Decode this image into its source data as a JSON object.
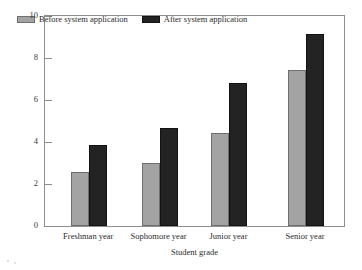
{
  "chart_data": {
    "type": "bar",
    "title": "",
    "xlabel": "Student grade",
    "ylabel": "Information Literacy rating",
    "categories": [
      "Freshman year",
      "Sophomore year",
      "Junior year",
      "Senior year"
    ],
    "series": [
      {
        "name": "Before system application",
        "color": "#a3a3a3",
        "values": [
          2.55,
          2.98,
          4.45,
          7.45
        ]
      },
      {
        "name": "After system application",
        "color": "#232323",
        "values": [
          3.85,
          4.65,
          6.8,
          9.15
        ]
      }
    ],
    "ylim": [
      0,
      10
    ],
    "yticks": [
      0,
      2,
      4,
      6,
      8,
      10
    ],
    "ytick_labels": [
      "0",
      "2",
      "4",
      "6",
      "8",
      "10"
    ],
    "grid": false,
    "legend_position": "top-left-inside",
    "legend_entries": [
      "Before system application",
      "After system application"
    ]
  },
  "axes": {
    "y_title": "Information Literacy rating",
    "x_title": "Student grade"
  }
}
